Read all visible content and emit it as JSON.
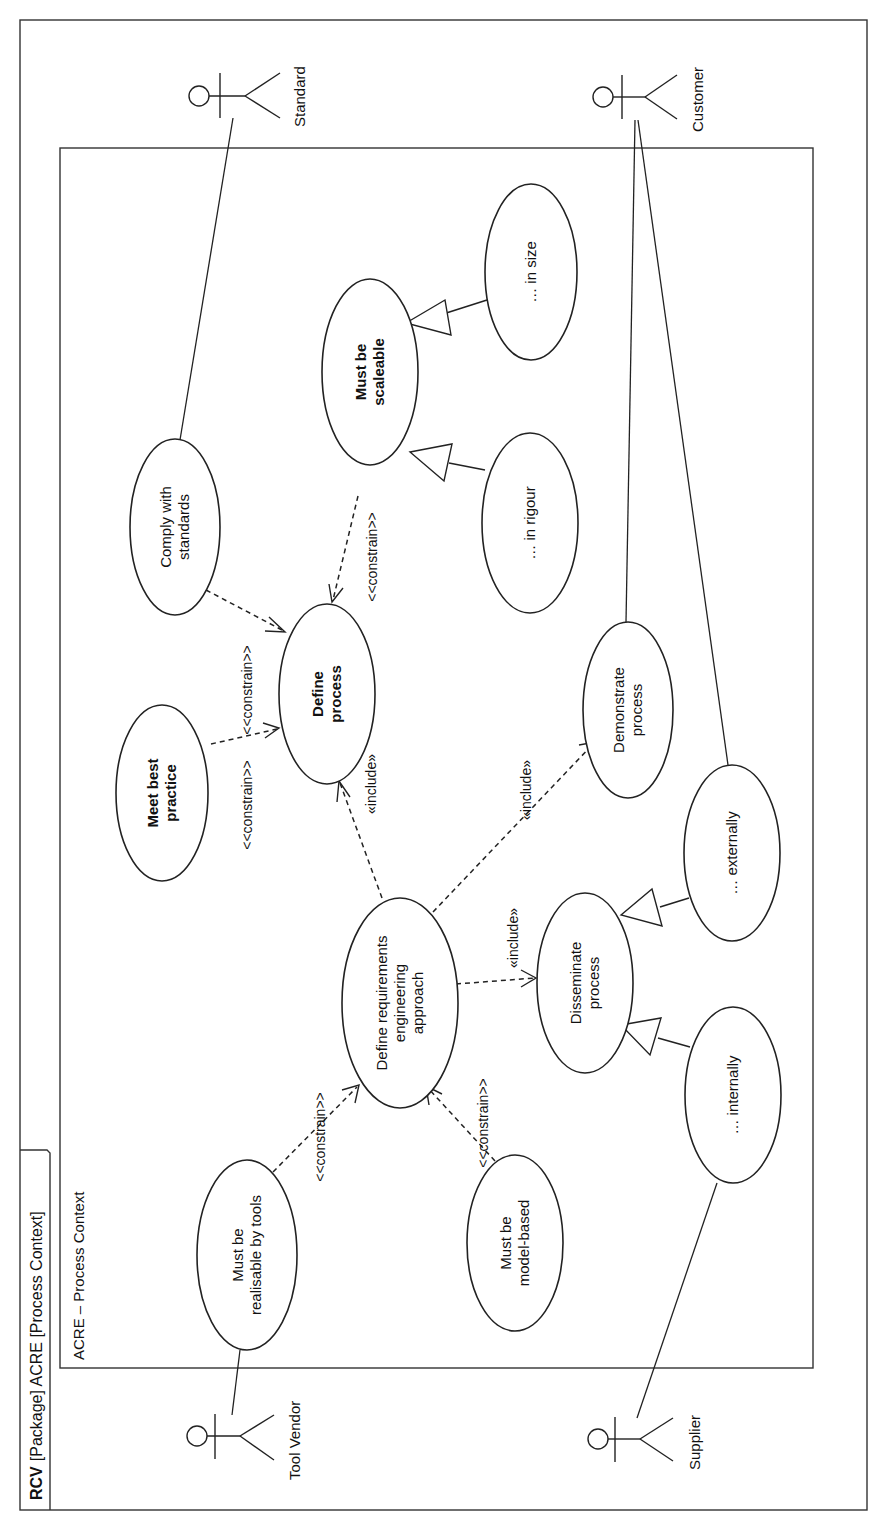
{
  "frame": {
    "kind": "RCV",
    "title": "[Package] ACRE [Process Context]"
  },
  "boundary": {
    "label": "ACRE – Process Context"
  },
  "actors": {
    "standard": "Standard",
    "customer": "Customer",
    "tool_vendor": "Tool Vendor",
    "supplier": "Supplier"
  },
  "use_cases": {
    "comply": [
      "Comply with",
      "standards"
    ],
    "best_practice": [
      "Meet best",
      "practice"
    ],
    "define_process": [
      "Define",
      "process"
    ],
    "scaleable": [
      "Must be",
      "scaleable"
    ],
    "in_size": [
      "… in size"
    ],
    "in_rigour": [
      "… in rigour"
    ],
    "demonstrate": [
      "Demonstrate",
      "process"
    ],
    "define_rea": [
      "Define requirements",
      "engineering",
      "approach"
    ],
    "disseminate": [
      "Disseminate",
      "process"
    ],
    "externally": [
      "… externally"
    ],
    "internally": [
      "… internally"
    ],
    "tools": [
      "Must be",
      "realisable by tools"
    ],
    "model_based": [
      "Must be",
      "model-based"
    ]
  },
  "stereotypes": {
    "constrain": "<<constrain>>",
    "include": "«include»"
  },
  "relationships": [
    {
      "type": "association",
      "from": "Standard",
      "to": "Comply with standards"
    },
    {
      "type": "association",
      "from": "Customer",
      "to": "Demonstrate process"
    },
    {
      "type": "association",
      "from": "Customer",
      "to": "… externally"
    },
    {
      "type": "association",
      "from": "Tool Vendor",
      "to": "Must be realisable by tools"
    },
    {
      "type": "association",
      "from": "Supplier",
      "to": "… internally"
    },
    {
      "type": "constrain",
      "from": "Comply with standards",
      "to": "Define process"
    },
    {
      "type": "constrain",
      "from": "Meet best practice",
      "to": "Define process"
    },
    {
      "type": "constrain",
      "from": "Must be scaleable",
      "to": "Define process"
    },
    {
      "type": "constrain",
      "from": "Must be realisable by tools",
      "to": "Define requirements engineering approach"
    },
    {
      "type": "constrain",
      "from": "Must be model-based",
      "to": "Define requirements engineering approach"
    },
    {
      "type": "include",
      "from": "Define requirements engineering approach",
      "to": "Define process"
    },
    {
      "type": "include",
      "from": "Define requirements engineering approach",
      "to": "Demonstrate process"
    },
    {
      "type": "include",
      "from": "Define requirements engineering approach",
      "to": "Disseminate process"
    },
    {
      "type": "generalization",
      "from": "… in size",
      "to": "Must be scaleable"
    },
    {
      "type": "generalization",
      "from": "… in rigour",
      "to": "Must be scaleable"
    },
    {
      "type": "generalization",
      "from": "… externally",
      "to": "Disseminate process"
    },
    {
      "type": "generalization",
      "from": "… internally",
      "to": "Disseminate process"
    }
  ]
}
